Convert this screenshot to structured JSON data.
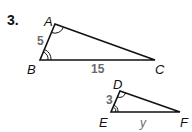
{
  "problem": {
    "number": "3."
  },
  "triangle1": {
    "vertices": {
      "A": "A",
      "B": "B",
      "C": "C"
    },
    "sides": {
      "AB": "5",
      "BC": "15"
    }
  },
  "triangle2": {
    "vertices": {
      "D": "D",
      "E": "E",
      "F": "F"
    },
    "sides": {
      "DE": "3",
      "EF": "y"
    }
  },
  "colors": {
    "stroke": "#111111",
    "side_label": "#6a6a6a"
  }
}
